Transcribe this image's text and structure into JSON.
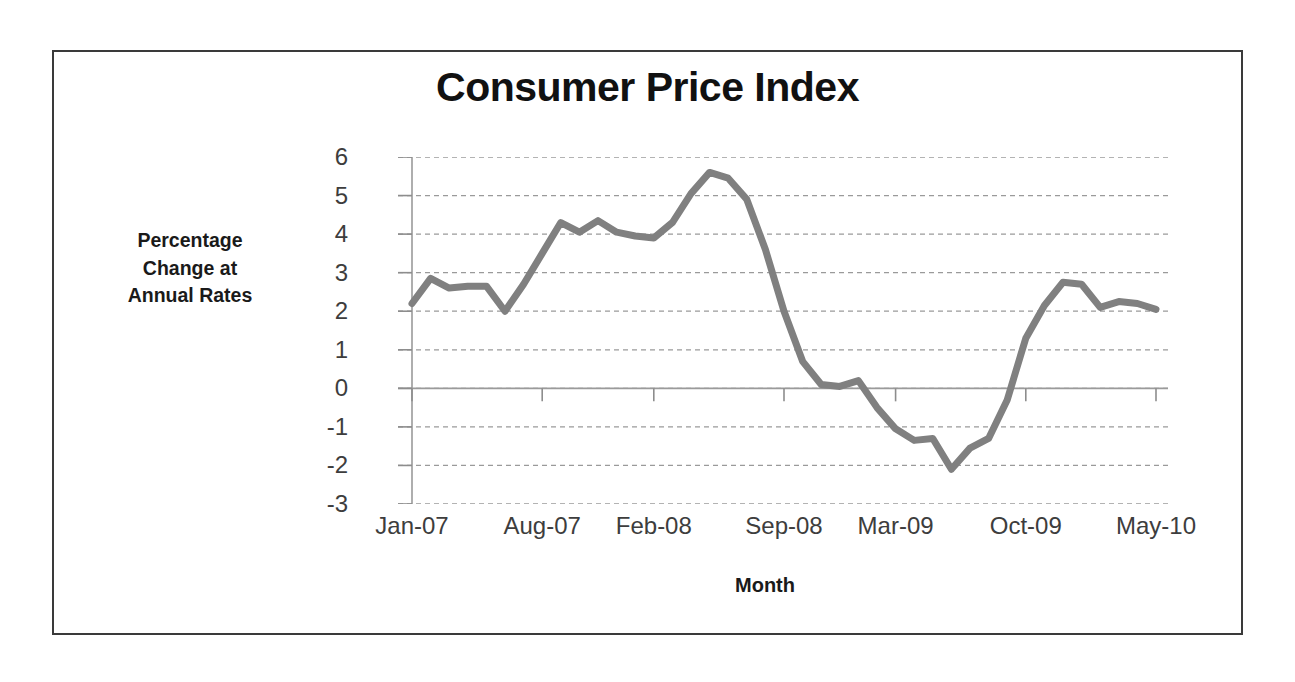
{
  "chart_data": {
    "type": "line",
    "title": "Consumer Price Index",
    "xlabel": "Month",
    "ylabel": "Percentage Change at Annual Rates",
    "ylabel_lines": [
      "Percentage",
      "Change at",
      "Annual Rates"
    ],
    "ylim": [
      -3,
      6
    ],
    "ytick_step": 1,
    "yticks": [
      6,
      5,
      4,
      3,
      2,
      1,
      0,
      -1,
      -2,
      -3
    ],
    "ytick_labels": [
      "6",
      "5",
      "4",
      "3",
      "2",
      "1",
      "0",
      "-1",
      "-2",
      "-3"
    ],
    "xticks": [
      0,
      7,
      13,
      20,
      26,
      33,
      40
    ],
    "xtick_labels": [
      "Jan-07",
      "Aug-07",
      "Feb-08",
      "Sep-08",
      "Mar-09",
      "Oct-09",
      "May-10"
    ],
    "grid": true,
    "grid_style": "dashed-horizontal",
    "legend": "none",
    "line_color": "#808080",
    "line_width": 7,
    "series": [
      {
        "name": "Consumer Price Index",
        "x": [
          0,
          1,
          2,
          3,
          4,
          5,
          6,
          7,
          8,
          9,
          10,
          11,
          12,
          13,
          14,
          15,
          16,
          17,
          18,
          19,
          20,
          21,
          22,
          23,
          24,
          25,
          26,
          27,
          28,
          29,
          30,
          31,
          32,
          33,
          34,
          35,
          36,
          37,
          38,
          39,
          40
        ],
        "values": [
          2.2,
          2.85,
          2.6,
          2.65,
          2.65,
          2.0,
          2.7,
          3.5,
          4.3,
          4.05,
          4.35,
          4.05,
          3.95,
          3.9,
          4.3,
          5.05,
          5.6,
          5.45,
          4.9,
          3.6,
          2.0,
          0.7,
          0.1,
          0.05,
          0.2,
          -0.5,
          -1.05,
          -1.35,
          -1.3,
          -2.1,
          -1.55,
          -1.3,
          -0.3,
          1.3,
          2.15,
          2.75,
          2.7,
          2.1,
          2.25,
          2.2,
          2.05
        ]
      }
    ]
  },
  "axis": {
    "x_tick_indices": [
      0,
      7,
      13,
      20,
      26,
      33,
      40
    ]
  }
}
